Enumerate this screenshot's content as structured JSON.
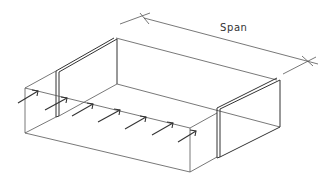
{
  "diagram": {
    "type": "isometric structural sketch",
    "labels": {
      "span": "Span"
    },
    "elements": {
      "dimension_line": "span",
      "wall_panels": 2,
      "load_arrows": 7
    }
  }
}
